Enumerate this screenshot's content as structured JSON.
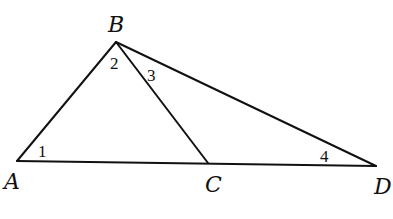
{
  "diagram": {
    "type": "geometry-triangle",
    "points": {
      "A": {
        "label": "A",
        "x": 17,
        "y": 161
      },
      "B": {
        "label": "B",
        "x": 116,
        "y": 42
      },
      "C": {
        "label": "C",
        "x": 208,
        "y": 163
      },
      "D": {
        "label": "D",
        "x": 376,
        "y": 166
      }
    },
    "segments": [
      "AB",
      "BC",
      "BD",
      "AD"
    ],
    "angles": [
      {
        "label": "1",
        "vertex": "A"
      },
      {
        "label": "2",
        "vertex": "B",
        "between": "BA-BC"
      },
      {
        "label": "3",
        "vertex": "B",
        "between": "BC-BD"
      },
      {
        "label": "4",
        "vertex": "D"
      }
    ],
    "colors": {
      "stroke": "#111111",
      "background": "#ffffff"
    }
  }
}
